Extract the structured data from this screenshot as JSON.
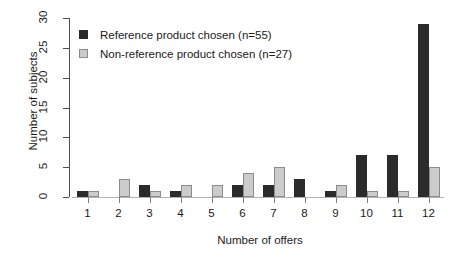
{
  "chart_data": {
    "type": "bar",
    "title": "",
    "subtitle": "",
    "xlabel": "Number of offers",
    "ylabel": "Number of subjects",
    "categories": [
      "1",
      "2",
      "3",
      "4",
      "5",
      "6",
      "7",
      "8",
      "9",
      "10",
      "11",
      "12"
    ],
    "series": [
      {
        "name": "Reference product chosen (n=55)",
        "color": "#2b2b2b",
        "values": [
          1,
          0,
          2,
          1,
          0,
          2,
          2,
          3,
          1,
          7,
          7,
          29
        ]
      },
      {
        "name": "Non-reference product chosen (n=27)",
        "color": "#cccccc",
        "values": [
          1,
          3,
          1,
          2,
          2,
          4,
          5,
          0,
          2,
          1,
          1,
          5
        ]
      }
    ],
    "ylim": [
      0,
      30
    ],
    "yticks": [
      0,
      5,
      10,
      15,
      20,
      25,
      30
    ],
    "ytick_labels": [
      "0",
      "5",
      "10",
      "15",
      "20",
      "25",
      "30"
    ],
    "xlim": [
      0.5,
      12.5
    ],
    "grid": false,
    "legend_position": "top-left"
  },
  "legend": {
    "entries": [
      {
        "label": "Reference product chosen (n=55)",
        "swatch": "dark"
      },
      {
        "label": "Non-reference product chosen (n=27)",
        "swatch": "light"
      }
    ]
  }
}
